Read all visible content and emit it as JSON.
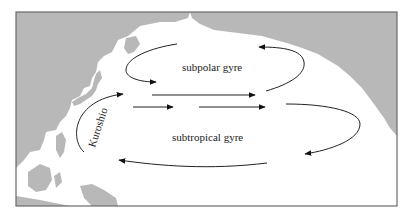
{
  "map": {
    "title": "North Pacific gyres",
    "labels": {
      "subpolar": "subpolar gyre",
      "subtropical": "subtropical gyre",
      "kuroshio": "Kuroshio"
    },
    "colors": {
      "land": "#b8b8b8",
      "ocean": "#ffffff",
      "arrows": "#222222",
      "frame": "#6a6a6a"
    }
  }
}
